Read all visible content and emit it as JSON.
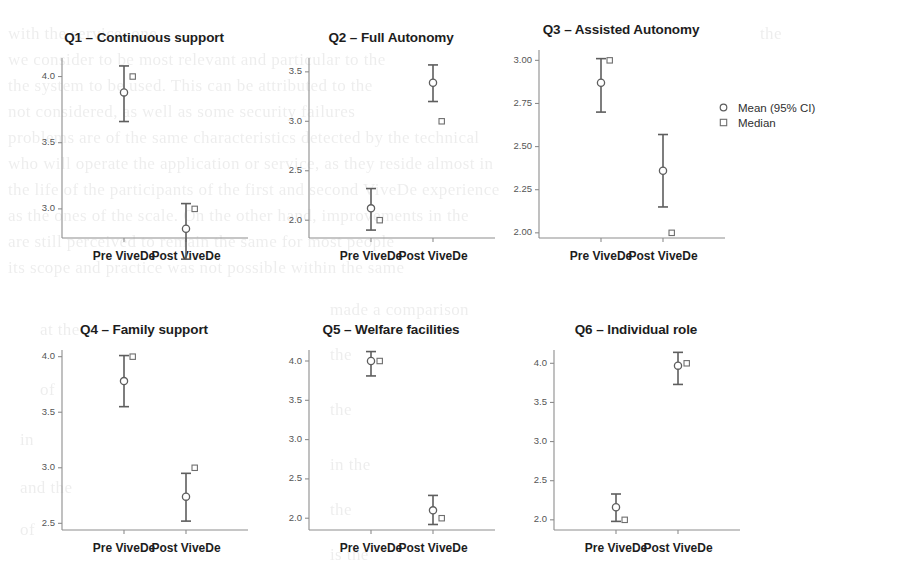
{
  "figure": {
    "background_color": "#ffffff",
    "ink_color": "#5e5e5e",
    "axis_color": "#8d8d8d",
    "title_color": "#1d1d1d"
  },
  "legend": {
    "name": "chart-legend",
    "entries": [
      {
        "marker": "circle-marker-icon",
        "label": "Mean (95% CI)"
      },
      {
        "marker": "square-marker-icon",
        "label": "Median"
      }
    ]
  },
  "ghost_text": [
    {
      "x": 8,
      "y": 24,
      "text": "with the service, one"
    },
    {
      "x": 760,
      "y": 24,
      "text": "the"
    },
    {
      "x": 8,
      "y": 50,
      "text": "we consider to be most relevant and particular to the"
    },
    {
      "x": 8,
      "y": 76,
      "text": "the system to be used. This can be attributed to the"
    },
    {
      "x": 8,
      "y": 102,
      "text": "not considered, as well as some security failures"
    },
    {
      "x": 8,
      "y": 128,
      "text": "problems are of the same characteristics detected by the technical"
    },
    {
      "x": 8,
      "y": 154,
      "text": "who will operate the application or service, as they reside almost in"
    },
    {
      "x": 8,
      "y": 180,
      "text": "the life of the participants of the first and second ViveDe experience"
    },
    {
      "x": 8,
      "y": 206,
      "text": "as the ones of the scale. On the other hand, improvements in the"
    },
    {
      "x": 8,
      "y": 232,
      "text": "are still perceived to remain the same for most people"
    },
    {
      "x": 8,
      "y": 258,
      "text": "its scope and practice was not possible within the same"
    },
    {
      "x": 330,
      "y": 300,
      "text": "made a comparison"
    },
    {
      "x": 40,
      "y": 320,
      "text": "at the"
    },
    {
      "x": 330,
      "y": 345,
      "text": "the"
    },
    {
      "x": 40,
      "y": 380,
      "text": "of"
    },
    {
      "x": 330,
      "y": 400,
      "text": "the"
    },
    {
      "x": 20,
      "y": 430,
      "text": "in"
    },
    {
      "x": 330,
      "y": 455,
      "text": "in the"
    },
    {
      "x": 20,
      "y": 478,
      "text": "and the"
    },
    {
      "x": 330,
      "y": 500,
      "text": "the"
    },
    {
      "x": 20,
      "y": 520,
      "text": "of"
    },
    {
      "x": 330,
      "y": 545,
      "text": "is the"
    }
  ],
  "chart_data": [
    {
      "id": "q1",
      "type": "scatter",
      "title": "Q1 – Continuous support",
      "xlabel": "",
      "ylabel": "",
      "categories": [
        "Pre ViveDe",
        "Post ViveDe"
      ],
      "yticks": [
        "3.0",
        "3.5",
        "4.0"
      ],
      "ytick_values": [
        3.0,
        3.5,
        4.0
      ],
      "ylim": [
        2.78,
        4.14
      ],
      "grid": false,
      "series": [
        {
          "name": "Mean (95% CI)",
          "marker": "circle",
          "values": [
            3.88,
            2.85
          ],
          "ci_lower": [
            3.66,
            2.62
          ],
          "ci_upper": [
            4.08,
            3.04
          ]
        },
        {
          "name": "Median",
          "marker": "square",
          "values": [
            4.0,
            3.0
          ]
        }
      ]
    },
    {
      "id": "q2",
      "type": "scatter",
      "title": "Q2 – Full Autonomy",
      "xlabel": "",
      "ylabel": "",
      "categories": [
        "Pre ViveDe",
        "Post ViveDe"
      ],
      "yticks": [
        "2.0",
        "2.5",
        "3.0",
        "3.5"
      ],
      "ytick_values": [
        2.0,
        2.5,
        3.0,
        3.5
      ],
      "ylim": [
        1.82,
        3.64
      ],
      "grid": false,
      "series": [
        {
          "name": "Mean (95% CI)",
          "marker": "circle",
          "values": [
            2.12,
            3.39
          ],
          "ci_lower": [
            1.9,
            3.2
          ],
          "ci_upper": [
            2.32,
            3.57
          ]
        },
        {
          "name": "Median",
          "marker": "square",
          "values": [
            2.0,
            3.0
          ]
        }
      ]
    },
    {
      "id": "q3",
      "type": "scatter",
      "title": "Q3 – Assisted Autonomy",
      "xlabel": "",
      "ylabel": "",
      "categories": [
        "Pre ViveDe",
        "Post ViveDe"
      ],
      "yticks": [
        "2.00",
        "2.25",
        "2.50",
        "2.75",
        "3.00"
      ],
      "ytick_values": [
        2.0,
        2.25,
        2.5,
        2.75,
        3.0
      ],
      "ylim": [
        1.97,
        3.06
      ],
      "grid": false,
      "series": [
        {
          "name": "Mean (95% CI)",
          "marker": "circle",
          "values": [
            2.87,
            2.36
          ],
          "ci_lower": [
            2.7,
            2.15
          ],
          "ci_upper": [
            3.01,
            2.57
          ]
        },
        {
          "name": "Median",
          "marker": "square",
          "values": [
            3.0,
            2.0
          ]
        }
      ]
    },
    {
      "id": "q4",
      "type": "scatter",
      "title": "Q4 – Family support",
      "xlabel": "",
      "ylabel": "",
      "categories": [
        "Pre ViveDe",
        "Post ViveDe"
      ],
      "yticks": [
        "2.5",
        "3.0",
        "3.5",
        "4.0"
      ],
      "ytick_values": [
        2.5,
        3.0,
        3.5,
        4.0
      ],
      "ylim": [
        2.44,
        4.06
      ],
      "grid": false,
      "series": [
        {
          "name": "Mean (95% CI)",
          "marker": "circle",
          "values": [
            3.78,
            2.74
          ],
          "ci_lower": [
            3.55,
            2.52
          ],
          "ci_upper": [
            4.01,
            2.95
          ]
        },
        {
          "name": "Median",
          "marker": "square",
          "values": [
            4.0,
            3.0
          ]
        }
      ]
    },
    {
      "id": "q5",
      "type": "scatter",
      "title": "Q5 – Welfare facilities",
      "xlabel": "",
      "ylabel": "",
      "categories": [
        "Pre ViveDe",
        "Post ViveDe"
      ],
      "yticks": [
        "2.0",
        "2.5",
        "3.0",
        "3.5",
        "4.0"
      ],
      "ytick_values": [
        2.0,
        2.5,
        3.0,
        3.5,
        4.0
      ],
      "ylim": [
        1.85,
        4.14
      ],
      "grid": false,
      "series": [
        {
          "name": "Mean (95% CI)",
          "marker": "circle",
          "values": [
            4.0,
            2.1
          ],
          "ci_lower": [
            3.81,
            1.92
          ],
          "ci_upper": [
            4.12,
            2.29
          ]
        },
        {
          "name": "Median",
          "marker": "square",
          "values": [
            4.0,
            2.0
          ]
        }
      ]
    },
    {
      "id": "q6",
      "type": "scatter",
      "title": "Q6 – Individual role",
      "xlabel": "",
      "ylabel": "",
      "categories": [
        "Pre ViveDe",
        "Post ViveDe"
      ],
      "yticks": [
        "2.0",
        "2.5",
        "3.0",
        "3.5",
        "4.0"
      ],
      "ytick_values": [
        2.0,
        2.5,
        3.0,
        3.5,
        4.0
      ],
      "ylim": [
        1.87,
        4.17
      ],
      "grid": false,
      "series": [
        {
          "name": "Mean (95% CI)",
          "marker": "circle",
          "values": [
            2.16,
            3.97
          ],
          "ci_lower": [
            1.98,
            3.73
          ],
          "ci_upper": [
            2.33,
            4.14
          ]
        },
        {
          "name": "Median",
          "marker": "square",
          "values": [
            2.0,
            4.0
          ]
        }
      ]
    }
  ],
  "layout": {
    "panels": [
      {
        "id": "q1",
        "left": 28,
        "top": 30,
        "width": 232,
        "height": 248
      },
      {
        "id": "q2",
        "left": 275,
        "top": 30,
        "width": 232,
        "height": 248
      },
      {
        "id": "q3",
        "left": 505,
        "top": 22,
        "width": 232,
        "height": 256
      },
      {
        "id": "q4",
        "left": 28,
        "top": 322,
        "width": 232,
        "height": 248
      },
      {
        "id": "q5",
        "left": 275,
        "top": 322,
        "width": 232,
        "height": 248
      },
      {
        "id": "q6",
        "left": 520,
        "top": 322,
        "width": 232,
        "height": 248
      }
    ],
    "legend_position": {
      "left": 718,
      "top": 100
    }
  }
}
